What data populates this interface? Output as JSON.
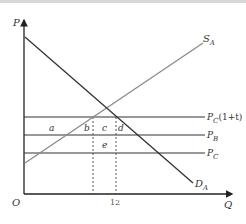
{
  "diagram": {
    "type": "supply-demand-tariff",
    "axes": {
      "y_label": "P",
      "x_label": "Q",
      "origin_label": "O",
      "x_tick_label": "12"
    },
    "curves": {
      "supply": {
        "label": "S",
        "subscript": "A",
        "color": "#888888"
      },
      "demand": {
        "label": "D",
        "subscript": "A",
        "color": "#333333"
      }
    },
    "price_lines": [
      {
        "label": "P",
        "subscript": "C",
        "suffix": "(1+t)"
      },
      {
        "label": "P",
        "subscript": "B",
        "suffix": ""
      },
      {
        "label": "P",
        "subscript": "C",
        "suffix": ""
      }
    ],
    "areas": {
      "a": "a",
      "b": "b",
      "c": "c",
      "d": "d",
      "e": "e"
    }
  }
}
